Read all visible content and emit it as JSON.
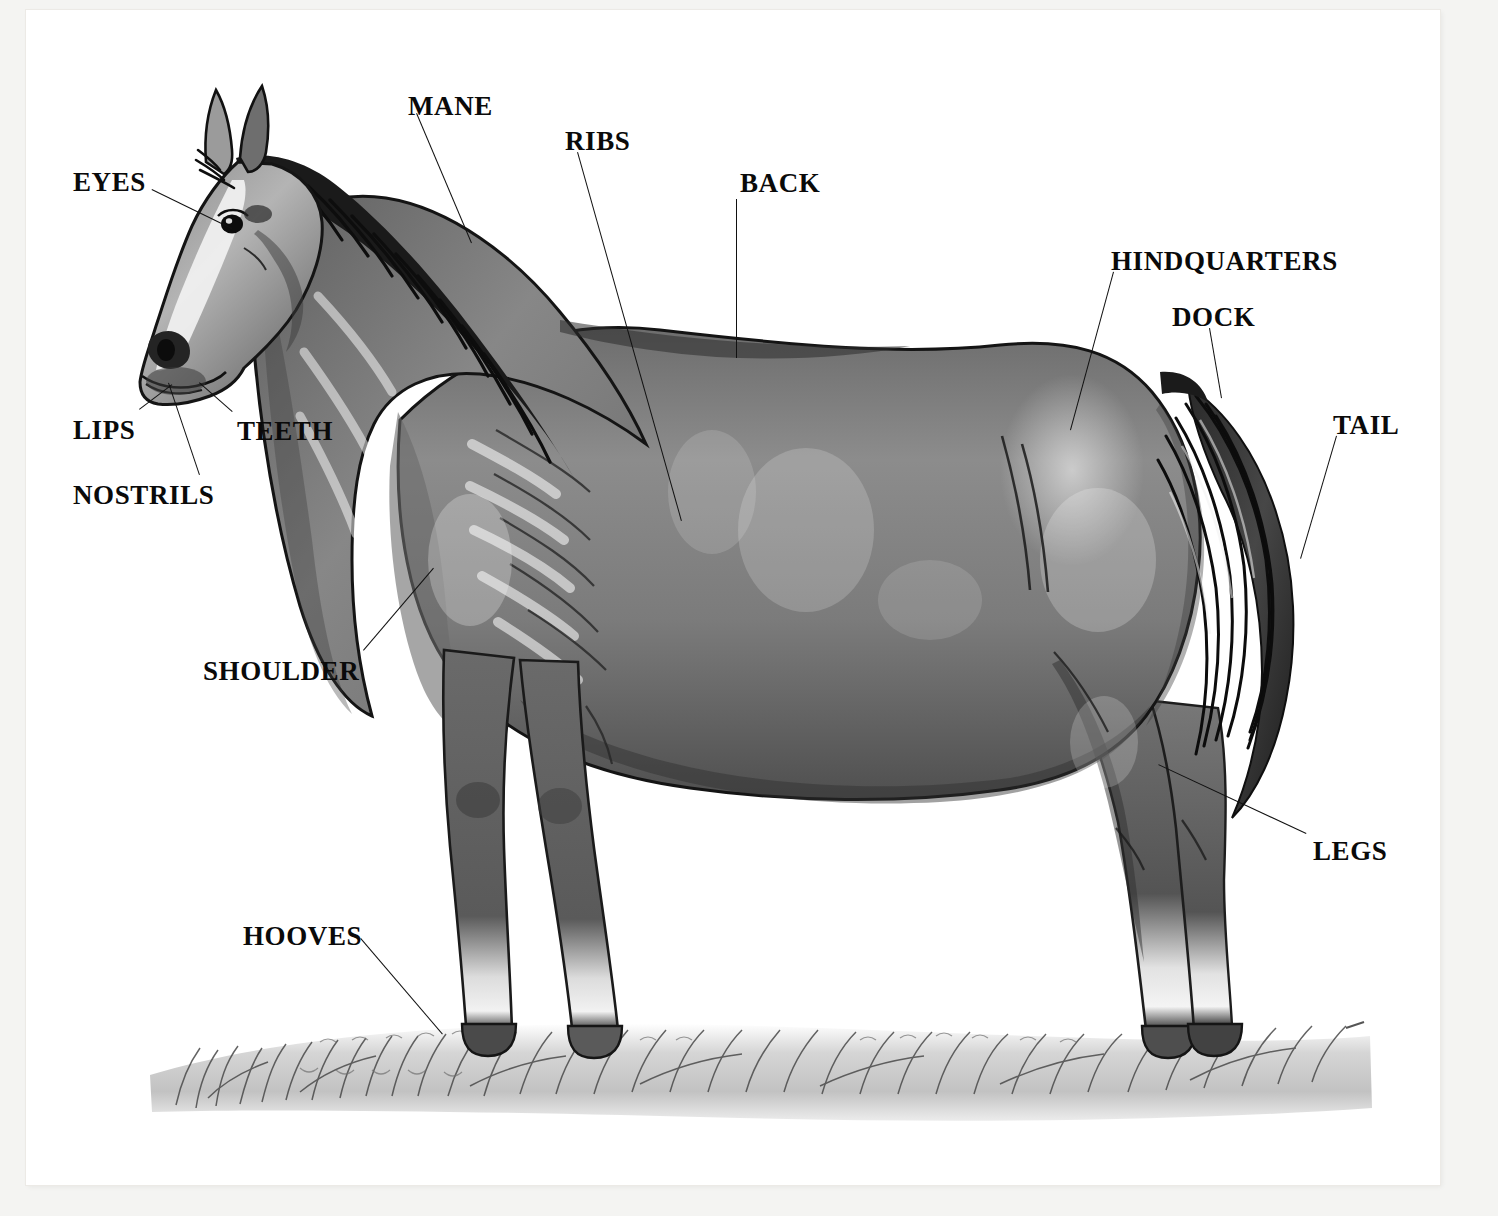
{
  "diagram": {
    "type": "labeled anatomy illustration",
    "style": "black and white ink and wash drawing",
    "background_color": "#ffffff",
    "page_color": "#f4f4f2",
    "label_color": "#0a0a0a",
    "leader_color": "#111111",
    "labels": [
      {
        "id": "eyes",
        "text": "EYES",
        "x": 73,
        "y": 169,
        "anchor": "left"
      },
      {
        "id": "mane",
        "text": "MANE",
        "x": 408,
        "y": 93,
        "anchor": "left"
      },
      {
        "id": "ribs",
        "text": "RIBS",
        "x": 565,
        "y": 128,
        "anchor": "left"
      },
      {
        "id": "back",
        "text": "BACK",
        "x": 740,
        "y": 170,
        "anchor": "left"
      },
      {
        "id": "hindquarters",
        "text": "HINDQUARTERS",
        "x": 1111,
        "y": 248,
        "anchor": "left"
      },
      {
        "id": "dock",
        "text": "DOCK",
        "x": 1172,
        "y": 304,
        "anchor": "left"
      },
      {
        "id": "tail",
        "text": "TAIL",
        "x": 1333,
        "y": 412,
        "anchor": "left"
      },
      {
        "id": "lips",
        "text": "LIPS",
        "x": 73,
        "y": 417,
        "anchor": "left"
      },
      {
        "id": "teeth",
        "text": "TEETH",
        "x": 237,
        "y": 418,
        "anchor": "left"
      },
      {
        "id": "nostrils",
        "text": "NOSTRILS",
        "x": 73,
        "y": 482,
        "anchor": "left"
      },
      {
        "id": "shoulder",
        "text": "SHOULDER",
        "x": 203,
        "y": 658,
        "anchor": "left"
      },
      {
        "id": "legs",
        "text": "LEGS",
        "x": 1313,
        "y": 838,
        "anchor": "left"
      },
      {
        "id": "hooves",
        "text": "HOOVES",
        "x": 243,
        "y": 923,
        "anchor": "left"
      }
    ],
    "leaders": [
      {
        "id": "eyes-leader",
        "x1": 152,
        "y1": 189,
        "x2": 232,
        "y2": 228
      },
      {
        "id": "mane-leader",
        "x1": 417,
        "y1": 113,
        "x2": 472,
        "y2": 243
      },
      {
        "id": "ribs-leader",
        "x1": 578,
        "y1": 152,
        "x2": 682,
        "y2": 521
      },
      {
        "id": "back-leader",
        "x1": 737,
        "y1": 199,
        "x2": 737,
        "y2": 358
      },
      {
        "id": "hindquarters-leader",
        "x1": 1114,
        "y1": 272,
        "x2": 1071,
        "y2": 430
      },
      {
        "id": "dock-leader",
        "x1": 1210,
        "y1": 328,
        "x2": 1222,
        "y2": 398
      },
      {
        "id": "tail-leader",
        "x1": 1337,
        "y1": 436,
        "x2": 1301,
        "y2": 559
      },
      {
        "id": "lips-leader",
        "x1": 139,
        "y1": 409,
        "x2": 172,
        "y2": 384
      },
      {
        "id": "teeth-leader",
        "x1": 232,
        "y1": 412,
        "x2": 199,
        "y2": 383
      },
      {
        "id": "nostrils-leader",
        "x1": 199,
        "y1": 475,
        "x2": 168,
        "y2": 383
      },
      {
        "id": "shoulder-leader",
        "x1": 363,
        "y1": 650,
        "x2": 433,
        "y2": 568
      },
      {
        "id": "legs-leader",
        "x1": 1306,
        "y1": 834,
        "x2": 1158,
        "y2": 765
      },
      {
        "id": "hooves-leader",
        "x1": 361,
        "y1": 938,
        "x2": 443,
        "y2": 1034
      }
    ]
  }
}
